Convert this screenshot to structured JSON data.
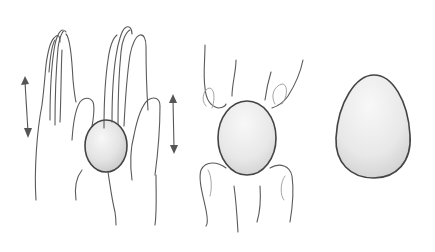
{
  "illustration": {
    "panels": [
      {
        "id": "rolling-between-palms",
        "motion_arrows": 2
      },
      {
        "id": "shaping-between-fingers"
      },
      {
        "id": "finished-egg-shape"
      }
    ],
    "colors": {
      "background": "#ffffff",
      "stroke": "#5a5a5a",
      "ball_fill_light": "#f4f4f4",
      "ball_fill_dark": "#d2d2d2"
    }
  }
}
